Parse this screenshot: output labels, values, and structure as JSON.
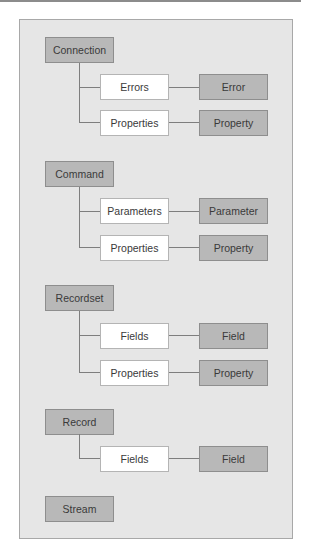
{
  "diagram": {
    "connection": {
      "label": "Connection",
      "collections": [
        {
          "label": "Errors",
          "item": "Error"
        },
        {
          "label": "Properties",
          "item": "Property"
        }
      ]
    },
    "command": {
      "label": "Command",
      "collections": [
        {
          "label": "Parameters",
          "item": "Parameter"
        },
        {
          "label": "Properties",
          "item": "Property"
        }
      ]
    },
    "recordset": {
      "label": "Recordset",
      "collections": [
        {
          "label": "Fields",
          "item": "Field"
        },
        {
          "label": "Properties",
          "item": "Property"
        }
      ]
    },
    "record": {
      "label": "Record",
      "collections": [
        {
          "label": "Fields",
          "item": "Field"
        }
      ]
    },
    "stream": {
      "label": "Stream"
    }
  },
  "colors": {
    "panel": "#e6e6e6",
    "object_box": "#b8b8b8",
    "collection_box": "#ffffff",
    "connector": "#7e7e7e"
  }
}
